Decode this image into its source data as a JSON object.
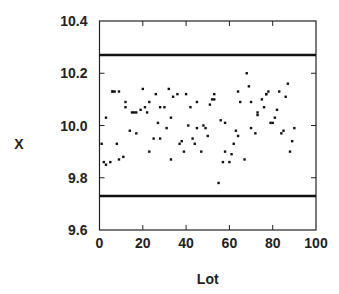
{
  "chart_data": {
    "type": "scatter",
    "title": "",
    "xlabel": "Lot",
    "ylabel": "X",
    "xlim": [
      0,
      100
    ],
    "ylim": [
      9.6,
      10.4
    ],
    "x_ticks": [
      0,
      20,
      40,
      60,
      80,
      100
    ],
    "x_tick_labels": [
      "0",
      "20",
      "40",
      "60",
      "80",
      "100"
    ],
    "y_ticks": [
      9.6,
      9.8,
      10.0,
      10.2,
      10.4
    ],
    "y_tick_labels": [
      "9.6",
      "9.8",
      "10.0",
      "10.2",
      "10.4"
    ],
    "grid": false,
    "legend": null,
    "control_limits": {
      "ucl": 10.27,
      "lcl": 9.73
    },
    "series": [
      {
        "name": "X",
        "marker": "dot",
        "color": "#111111",
        "x": [
          1,
          2,
          3,
          3,
          5,
          6,
          6,
          7,
          8,
          9,
          9,
          11,
          12,
          12,
          14,
          15,
          16,
          17,
          17,
          19,
          20,
          21,
          22,
          23,
          23,
          25,
          26,
          27,
          28,
          28,
          30,
          31,
          32,
          33,
          33,
          34,
          36,
          37,
          38,
          39,
          40,
          41,
          42,
          43,
          44,
          45,
          45,
          47,
          48,
          49,
          50,
          51,
          52,
          53,
          53,
          55,
          56,
          57,
          58,
          58,
          60,
          61,
          62,
          63,
          64,
          64,
          65,
          67,
          68,
          69,
          70,
          70,
          72,
          73,
          73,
          75,
          76,
          77,
          77,
          78,
          79,
          80,
          81,
          82,
          83,
          84,
          85,
          86,
          87,
          88,
          89,
          90
        ],
        "y": [
          9.93,
          9.86,
          10.03,
          9.85,
          9.86,
          10.13,
          10.13,
          10.13,
          9.93,
          9.87,
          10.13,
          9.88,
          10.09,
          10.07,
          9.98,
          10.05,
          10.05,
          10.05,
          9.97,
          10.06,
          10.14,
          10.07,
          10.05,
          9.9,
          10.09,
          9.95,
          10.12,
          10.01,
          9.95,
          10.07,
          10.07,
          9.99,
          10.14,
          10.03,
          9.87,
          10.11,
          10.12,
          9.93,
          9.94,
          9.9,
          10.12,
          10.0,
          10.07,
          9.95,
          9.93,
          9.99,
          10.09,
          9.9,
          10.0,
          9.99,
          9.96,
          10.08,
          10.1,
          10.1,
          10.12,
          9.78,
          10.02,
          9.86,
          10.01,
          9.9,
          9.86,
          9.89,
          9.93,
          9.98,
          10.13,
          9.96,
          10.09,
          9.87,
          10.2,
          10.15,
          9.99,
          10.09,
          9.97,
          10.05,
          10.04,
          10.1,
          10.07,
          10.12,
          10.12,
          10.13,
          10.01,
          10.01,
          10.03,
          10.06,
          10.13,
          9.97,
          9.98,
          10.11,
          10.16,
          9.9,
          9.94,
          9.99
        ]
      }
    ]
  },
  "colors": {
    "axis": "#222222",
    "limit_line": "#111111",
    "point": "#111111",
    "background": "#ffffff"
  }
}
